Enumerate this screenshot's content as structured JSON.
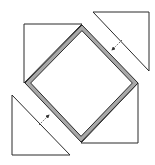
{
  "diagram": {
    "colors": {
      "background": "#ffffff",
      "line": "#2a2a2a",
      "frame_fill": "#a8a8a8",
      "arrow": "#333333"
    },
    "diamond": {
      "points": [
        [
          82,
          25
        ],
        [
          138,
          83
        ],
        [
          81,
          142
        ],
        [
          25,
          83
        ]
      ],
      "frame_width": 4
    },
    "triangles": [
      {
        "name": "top-left-triangle",
        "points": [
          [
            24,
            24
          ],
          [
            82,
            24
          ],
          [
            24,
            83
          ]
        ]
      },
      {
        "name": "bottom-right-triangle",
        "points": [
          [
            138,
            83
          ],
          [
            138,
            143
          ],
          [
            81,
            143
          ]
        ]
      },
      {
        "name": "top-right-detached-triangle",
        "points": [
          [
            93,
            12
          ],
          [
            149,
            12
          ],
          [
            149,
            71
          ]
        ]
      },
      {
        "name": "bottom-left-detached-triangle",
        "points": [
          [
            12,
            95
          ],
          [
            12,
            155
          ],
          [
            70,
            155
          ]
        ]
      }
    ],
    "arrows": [
      {
        "name": "fold-arrow-down-left",
        "from": [
          122,
          40
        ],
        "to": [
          112,
          50
        ]
      },
      {
        "name": "fold-arrow-up-right",
        "from": [
          39,
          125
        ],
        "to": [
          49,
          115
        ]
      }
    ]
  }
}
